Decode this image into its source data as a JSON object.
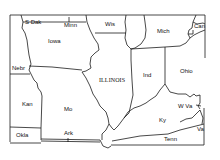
{
  "map": {
    "title": "",
    "focus_state": "ILLINOIS",
    "line_color": "#1a1a1a",
    "background": "#ffffff",
    "labels": {
      "s_dak": "S Dak",
      "minn": "Minn",
      "wis": "Wis",
      "mich": "Mich",
      "can": "Can",
      "iowa": "Iowa",
      "nebr": "Nebr",
      "illinois": "ILLINOIS",
      "ind": "Ind",
      "ohio": "Ohio",
      "kan": "Kan",
      "mo": "Mo",
      "w_va": "W Va",
      "ky": "Ky",
      "va": "Va",
      "okla": "Okla",
      "ark": "Ark",
      "tenn": "Tenn"
    }
  }
}
